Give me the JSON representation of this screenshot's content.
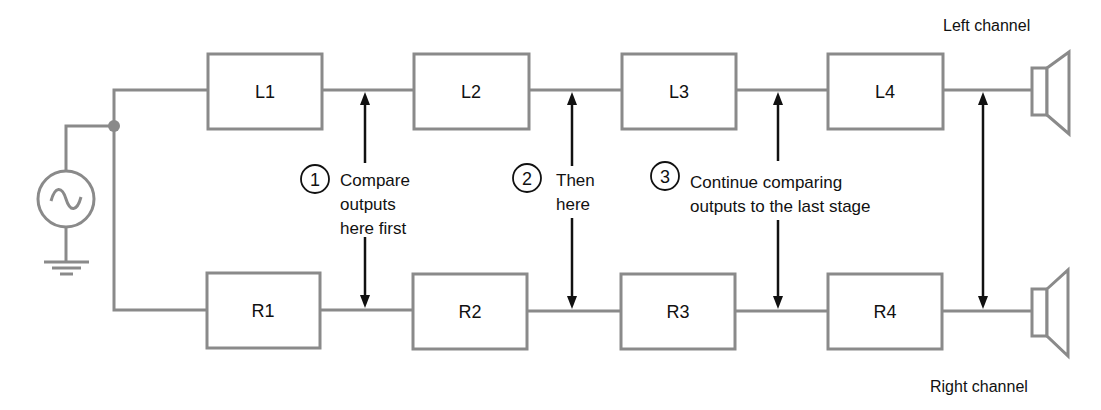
{
  "diagram": {
    "colors": {
      "wire": "#8a8a8a",
      "arrow": "#111111",
      "background": "#ffffff"
    },
    "source": {
      "icon": "ac-source-icon",
      "ground_icon": "ground-icon"
    },
    "left_channel": {
      "label": "Left channel",
      "stages": [
        {
          "id": "L1",
          "label": "L1"
        },
        {
          "id": "L2",
          "label": "L2"
        },
        {
          "id": "L3",
          "label": "L3"
        },
        {
          "id": "L4",
          "label": "L4"
        }
      ],
      "output_icon": "speaker-icon"
    },
    "right_channel": {
      "label": "Right channel",
      "stages": [
        {
          "id": "R1",
          "label": "R1"
        },
        {
          "id": "R2",
          "label": "R2"
        },
        {
          "id": "R3",
          "label": "R3"
        },
        {
          "id": "R4",
          "label": "R4"
        }
      ],
      "output_icon": "speaker-icon"
    },
    "steps": [
      {
        "number": "1",
        "lines": [
          "Compare",
          "outputs",
          "here first"
        ]
      },
      {
        "number": "2",
        "lines": [
          "Then",
          "here"
        ]
      },
      {
        "number": "3",
        "lines": [
          "Continue comparing",
          "outputs to the last stage"
        ]
      }
    ]
  }
}
